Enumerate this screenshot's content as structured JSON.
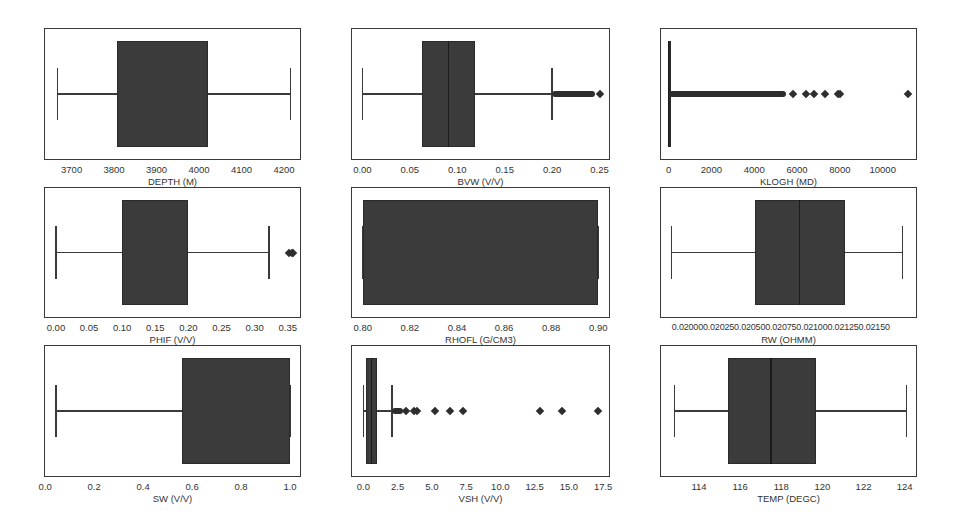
{
  "chart_data": [
    {
      "type": "box",
      "title": "",
      "xlabel": "DEPTH (M)",
      "ticks": [
        "3700",
        "3800",
        "3900",
        "4000",
        "4100",
        "4200"
      ],
      "tick_values": [
        3700,
        3800,
        3900,
        4000,
        4100,
        4200
      ],
      "xlim": [
        3635,
        4240
      ],
      "stats": {
        "whislo": 3667,
        "q1": 3808,
        "med": 3915,
        "q3": 4020,
        "whishi": 4215
      },
      "fliers": [],
      "median_visible": false
    },
    {
      "type": "box",
      "title": "",
      "xlabel": "BVW (V/V)",
      "ticks": [
        "0.00",
        "0.05",
        "0.10",
        "0.15",
        "0.20",
        "0.25"
      ],
      "tick_values": [
        0.0,
        0.05,
        0.1,
        0.15,
        0.2,
        0.25
      ],
      "xlim": [
        -0.012,
        0.261
      ],
      "stats": {
        "whislo": 0.0,
        "q1": 0.063,
        "med": 0.091,
        "q3": 0.119,
        "whishi": 0.2
      },
      "flier_band": [
        0.2,
        0.245
      ],
      "fliers": [
        0.25
      ]
    },
    {
      "type": "box",
      "title": "",
      "xlabel": "KLOGH (MD)",
      "ticks": [
        "0",
        "2000",
        "4000",
        "6000",
        "8000",
        "10000"
      ],
      "tick_values": [
        0,
        2000,
        4000,
        6000,
        8000,
        10000
      ],
      "xlim": [
        -400,
        11600
      ],
      "stats": {
        "whislo": 0,
        "q1": 0,
        "med": 5,
        "q3": 15,
        "whishi": 40
      },
      "flier_band": [
        40,
        5500
      ],
      "fliers": [
        5800,
        6400,
        6800,
        7300,
        7900,
        8000,
        11200
      ]
    },
    {
      "type": "box",
      "title": "",
      "xlabel": "PHIF (V/V)",
      "ticks": [
        "0.00",
        "0.05",
        "0.10",
        "0.15",
        "0.20",
        "0.25",
        "0.30",
        "0.35"
      ],
      "tick_values": [
        0.0,
        0.05,
        0.1,
        0.15,
        0.2,
        0.25,
        0.3,
        0.35
      ],
      "xlim": [
        -0.018,
        0.37
      ],
      "stats": {
        "whislo": 0.0,
        "q1": 0.1,
        "med": 0.15,
        "q3": 0.2,
        "whishi": 0.322
      },
      "fliers": [
        0.352,
        0.356,
        0.358
      ],
      "median_visible": false
    },
    {
      "type": "box",
      "title": "",
      "xlabel": "RHOFL (G/CM3)",
      "ticks": [
        "0.80",
        "0.82",
        "0.84",
        "0.86",
        "0.88",
        "0.90"
      ],
      "tick_values": [
        0.8,
        0.82,
        0.84,
        0.86,
        0.88,
        0.9
      ],
      "xlim": [
        0.795,
        0.905
      ],
      "stats": {
        "whislo": 0.8,
        "q1": 0.8,
        "med": 0.85,
        "q3": 0.9,
        "whishi": 0.9
      },
      "fliers": [],
      "median_visible": false
    },
    {
      "type": "box",
      "title": "",
      "xlabel": "RW (OHMM)",
      "ticks": [
        "0.02000",
        "0.02025",
        "0.02050",
        "0.02075",
        "0.02100",
        "0.02125",
        "0.02150"
      ],
      "tick_label_text": "0.020000.020250.020500.020750.021000.021250.02150",
      "tick_values": [
        0.02,
        0.02025,
        0.0205,
        0.02075,
        0.021,
        0.02125,
        0.0215
      ],
      "xlim": [
        0.01992,
        0.02171
      ],
      "stats": {
        "whislo": 0.02,
        "q1": 0.02058,
        "med": 0.02089,
        "q3": 0.02121,
        "whishi": 0.02161
      },
      "fliers": []
    },
    {
      "type": "box",
      "title": "",
      "xlabel": "SW (V/V)",
      "ticks": [
        "0.0",
        "0.2",
        "0.4",
        "0.6",
        "0.8",
        "1.0"
      ],
      "tick_values": [
        0.0,
        0.2,
        0.4,
        0.6,
        0.8,
        1.0
      ],
      "xlim": [
        -0.005,
        1.045
      ],
      "stats": {
        "whislo": 0.045,
        "q1": 0.56,
        "med": 1.0,
        "q3": 1.0,
        "whishi": 1.0
      },
      "fliers": [],
      "median_visible": false
    },
    {
      "type": "box",
      "title": "",
      "xlabel": "VSH (V/V)",
      "ticks": [
        "0.0",
        "2.5",
        "5.0",
        "7.5",
        "10.0",
        "12.5",
        "15.0",
        "17.5"
      ],
      "tick_values": [
        0.0,
        2.5,
        5.0,
        7.5,
        10.0,
        12.5,
        15.0,
        17.5
      ],
      "xlim": [
        -0.9,
        18.0
      ],
      "stats": {
        "whislo": 0.0,
        "q1": 0.2,
        "med": 0.6,
        "q3": 1.0,
        "whishi": 2.1
      },
      "flier_band": [
        2.1,
        2.9
      ],
      "fliers": [
        3.1,
        3.7,
        3.9,
        5.2,
        6.3,
        7.3,
        12.9,
        14.5,
        17.1
      ]
    },
    {
      "type": "box",
      "title": "",
      "xlabel": "TEMP (DEGC)",
      "ticks": [
        "114",
        "116",
        "118",
        "120",
        "122",
        "124"
      ],
      "tick_values": [
        114,
        116,
        118,
        120,
        122,
        124
      ],
      "xlim": [
        112.1,
        124.6
      ],
      "stats": {
        "whislo": 112.8,
        "q1": 115.4,
        "med": 117.5,
        "q3": 119.7,
        "whishi": 124.1
      },
      "fliers": []
    }
  ],
  "layout": {
    "grid": "3x3",
    "box_color": "#3b3b3b",
    "frame_color": "#3a3a3a",
    "background": "#ffffff"
  }
}
